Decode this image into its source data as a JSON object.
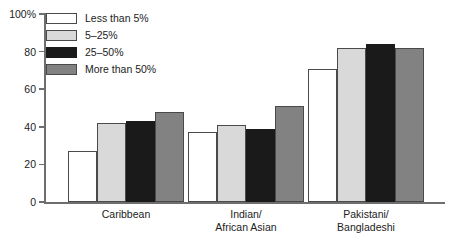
{
  "chart_data": {
    "type": "bar",
    "title": "",
    "subtitle": "",
    "xlabel": "",
    "ylabel": "",
    "ylim": [
      0,
      100
    ],
    "yticks": [
      "0",
      "20",
      "40",
      "60",
      "80",
      "100%"
    ],
    "ytick_values": [
      0,
      20,
      40,
      60,
      80,
      100
    ],
    "grid": false,
    "legend_position": "top-left",
    "categories": [
      "Caribbean",
      "Indian/\nAfrican Asian",
      "Pakistani/\nBangladeshi"
    ],
    "series": [
      {
        "name": "Less than 5%",
        "color": "#ffffff",
        "values": [
          27,
          37,
          71
        ]
      },
      {
        "name": "5–25%",
        "color": "#d9d9d9",
        "values": [
          42,
          41,
          82
        ]
      },
      {
        "name": "25–50%",
        "color": "#1a1a1a",
        "values": [
          43,
          39,
          84
        ]
      },
      {
        "name": "More than 50%",
        "color": "#828282",
        "values": [
          48,
          51,
          82
        ]
      }
    ]
  },
  "legend": {
    "items": [
      {
        "label": "Less than 5%",
        "swatch": "sw-white"
      },
      {
        "label": "5–25%",
        "swatch": "sw-light"
      },
      {
        "label": "25–50%",
        "swatch": "sw-black"
      },
      {
        "label": "More than 50%",
        "swatch": "sw-gray"
      }
    ]
  },
  "axis": {
    "y_tick_labels": [
      "100%",
      "80",
      "60",
      "40",
      "20",
      "0"
    ]
  }
}
